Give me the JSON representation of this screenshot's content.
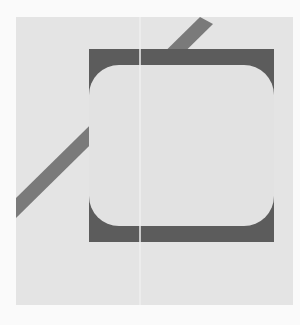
{
  "figure": {
    "background_color": "#fafafa",
    "panel": {
      "color": "#e4e4e4",
      "x": 16,
      "y": 17,
      "width": 277,
      "height": 288
    },
    "diagonal_bar": {
      "color": "#7a7a7a",
      "points": [
        [
          16,
          198
        ],
        [
          200,
          17
        ],
        [
          213,
          24
        ],
        [
          16,
          218
        ]
      ]
    },
    "dark_square": {
      "color": "#5c5c5c",
      "x": 89,
      "y": 49,
      "width": 185,
      "height": 193
    },
    "inner_rounded_rect": {
      "color": "#e2e2e2",
      "x": 89,
      "y": 65,
      "width": 185,
      "height": 161,
      "radius": 30
    },
    "divider_line": {
      "color": "#efefef",
      "x": 140
    }
  }
}
